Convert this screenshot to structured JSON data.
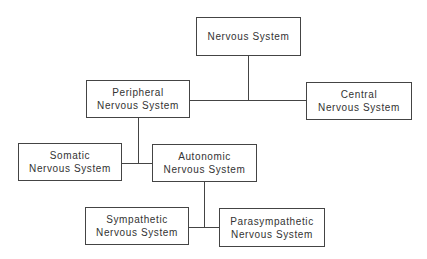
{
  "diagram": {
    "type": "hierarchy",
    "nodes": [
      {
        "id": "nervous",
        "lines": [
          "Nervous System"
        ]
      },
      {
        "id": "peripheral",
        "lines": [
          "Peripheral",
          "Nervous System"
        ]
      },
      {
        "id": "central",
        "lines": [
          "Central",
          "Nervous System"
        ]
      },
      {
        "id": "somatic",
        "lines": [
          "Somatic",
          "Nervous System"
        ]
      },
      {
        "id": "autonomic",
        "lines": [
          "Autonomic",
          "Nervous System"
        ]
      },
      {
        "id": "sympathetic",
        "lines": [
          "Sympathetic",
          "Nervous System"
        ]
      },
      {
        "id": "parasympathetic",
        "lines": [
          "Parasympathetic",
          "Nervous System"
        ]
      }
    ],
    "edges": [
      {
        "from": "nervous",
        "to": "peripheral"
      },
      {
        "from": "nervous",
        "to": "central"
      },
      {
        "from": "peripheral",
        "to": "somatic"
      },
      {
        "from": "peripheral",
        "to": "autonomic"
      },
      {
        "from": "autonomic",
        "to": "sympathetic"
      },
      {
        "from": "autonomic",
        "to": "parasympathetic"
      }
    ]
  }
}
